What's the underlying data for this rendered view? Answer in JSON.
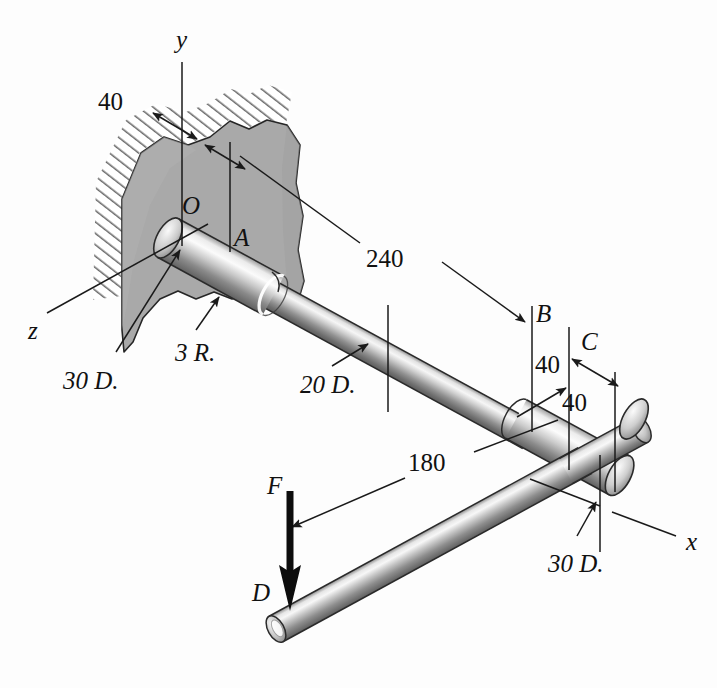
{
  "figure": {
    "background_color": "#fdfdfd",
    "line_color": "#1a1a1a",
    "wall_fill": "#a8a8a8",
    "wall_edge": "#2b2b2b",
    "shaft_light": "#f2f2f2",
    "shaft_mid": "#bfbfbf",
    "shaft_dark": "#6e6e6e"
  },
  "axes": [
    {
      "name": "y-axis",
      "label": "y",
      "x": 176,
      "y": 27
    },
    {
      "name": "z-axis",
      "label": "z",
      "x": 28,
      "y": 318
    },
    {
      "name": "x-axis",
      "label": "x",
      "x": 686,
      "y": 529
    }
  ],
  "points": [
    {
      "name": "point-O",
      "label": "O",
      "x": 182,
      "y": 193
    },
    {
      "name": "point-A",
      "label": "A",
      "x": 234,
      "y": 225
    },
    {
      "name": "point-B",
      "label": "B",
      "x": 536,
      "y": 301
    },
    {
      "name": "point-C",
      "label": "C",
      "x": 581,
      "y": 329
    },
    {
      "name": "point-D",
      "label": "D",
      "x": 252,
      "y": 580
    },
    {
      "name": "force-F",
      "label": "F",
      "x": 267,
      "y": 473
    }
  ],
  "dimensions": [
    {
      "name": "dim-40-wall",
      "label": "40",
      "x": 98,
      "y": 89
    },
    {
      "name": "dim-240",
      "label": "240",
      "x": 366,
      "y": 246
    },
    {
      "name": "dim-40-b-to-c",
      "label": "40",
      "x": 535,
      "y": 352
    },
    {
      "name": "dim-40-c-to-end",
      "label": "40",
      "x": 562,
      "y": 390
    },
    {
      "name": "dim-180",
      "label": "180",
      "x": 408,
      "y": 450
    }
  ],
  "notes": [
    {
      "name": "note-30-d-left",
      "label": "30 D.",
      "x": 63,
      "y": 368
    },
    {
      "name": "note-3-r",
      "label": "3 R.",
      "x": 175,
      "y": 340
    },
    {
      "name": "note-20-d",
      "label": "20 D.",
      "x": 300,
      "y": 372
    },
    {
      "name": "note-30-d-right",
      "label": "30 D.",
      "x": 548,
      "y": 551
    }
  ],
  "callouts": {
    "force_label": "F",
    "force_direction": "downward"
  }
}
